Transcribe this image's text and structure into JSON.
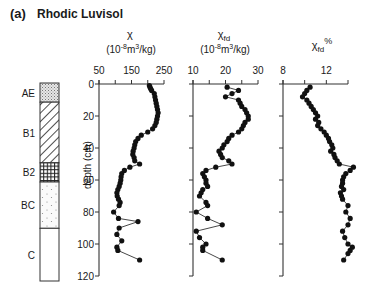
{
  "panel_label": "(a)",
  "title": "Rhodic Luvisol",
  "y_axis": {
    "label": "depth (cm)",
    "ticks": [
      0,
      20,
      40,
      60,
      80,
      100,
      120
    ],
    "range": [
      0,
      120
    ]
  },
  "horizons": [
    {
      "name": "AE",
      "top": 0,
      "bottom": 12,
      "pattern": "stipple"
    },
    {
      "name": "B1",
      "top": 12,
      "bottom": 50,
      "pattern": "diagonal-hatch"
    },
    {
      "name": "B2",
      "top": 50,
      "bottom": 62,
      "pattern": "crosshatch"
    },
    {
      "name": "BC",
      "top": 62,
      "bottom": 91,
      "pattern": "dots"
    },
    {
      "name": "C",
      "top": 91,
      "bottom": 124,
      "pattern": "blank"
    }
  ],
  "chart_data": [
    {
      "type": "line",
      "title": "χ",
      "unit": "(10-8m3/kg)",
      "xlabel": "χ (10^-8 m^3/kg)",
      "ylabel": "depth (cm)",
      "x_ticks": [
        "50",
        "150",
        "250"
      ],
      "xlim": [
        50,
        250
      ],
      "ylim": [
        0,
        120
      ],
      "depth": [
        1,
        2,
        3,
        4,
        6,
        8,
        10,
        12,
        14,
        16,
        18,
        20,
        22,
        24,
        26,
        28,
        30,
        32,
        34,
        36,
        38,
        40,
        42,
        44,
        46,
        48,
        50,
        52,
        54,
        56,
        58,
        60,
        62,
        64,
        66,
        68,
        70,
        72,
        74,
        76,
        80,
        84,
        86,
        90,
        94,
        98,
        102,
        104,
        110
      ],
      "values": [
        205,
        207,
        209,
        212,
        220,
        222,
        224,
        226,
        228,
        230,
        232,
        230,
        228,
        226,
        222,
        215,
        200,
        180,
        170,
        163,
        160,
        158,
        155,
        154,
        158,
        160,
        175,
        145,
        128,
        120,
        118,
        117,
        115,
        112,
        108,
        105,
        106,
        110,
        115,
        112,
        95,
        110,
        170,
        112,
        105,
        120,
        105,
        108,
        175
      ]
    },
    {
      "type": "line",
      "title": "χfd",
      "unit": "(10-8m3/kg)",
      "xlabel": "χfd (10^-8 m^3/kg)",
      "ylabel": "depth (cm)",
      "x_ticks": [
        "10",
        "20",
        "30"
      ],
      "xlim": [
        10,
        30
      ],
      "ylim": [
        0,
        120
      ],
      "depth": [
        2,
        4,
        6,
        8,
        10,
        12,
        14,
        16,
        18,
        20,
        22,
        24,
        26,
        28,
        30,
        32,
        34,
        36,
        38,
        40,
        42,
        44,
        46,
        48,
        50,
        52,
        54,
        56,
        58,
        60,
        62,
        64,
        66,
        68,
        70,
        74,
        76,
        80,
        84,
        88,
        92,
        96,
        100,
        102,
        104,
        110
      ],
      "values": [
        20.5,
        24,
        22,
        20,
        24,
        24.5,
        25,
        26,
        26.5,
        27,
        27,
        26,
        25.5,
        25,
        24,
        22,
        21,
        20.5,
        19.5,
        19,
        18,
        18.5,
        19,
        21,
        22,
        17,
        14,
        13,
        13.5,
        14,
        14,
        14.5,
        13,
        12.5,
        12,
        14,
        14.5,
        11,
        14.5,
        19,
        11,
        12,
        14,
        13,
        13,
        19
      ]
    },
    {
      "type": "line",
      "title": "χfd%",
      "unit": "",
      "xlabel": "χfd %",
      "ylabel": "depth (cm)",
      "x_ticks": [
        "8",
        "12"
      ],
      "xlim": [
        8,
        14
      ],
      "ylim": [
        0,
        120
      ],
      "depth": [
        2,
        4,
        6,
        8,
        10,
        12,
        14,
        16,
        18,
        20,
        22,
        24,
        26,
        28,
        30,
        32,
        34,
        36,
        38,
        40,
        42,
        44,
        46,
        48,
        50,
        52,
        54,
        56,
        58,
        60,
        62,
        64,
        66,
        68,
        70,
        72,
        76,
        80,
        84,
        88,
        92,
        96,
        100,
        102,
        104,
        106,
        110
      ],
      "values": [
        10.5,
        10.2,
        10,
        9.8,
        10.2,
        10.4,
        10.6,
        10.8,
        11,
        11.2,
        11,
        11.3,
        11.2,
        11.5,
        11.8,
        12,
        12.2,
        12.3,
        12.5,
        12.6,
        12.4,
        12.7,
        12.8,
        13,
        13.2,
        14.5,
        14.2,
        13.8,
        13.6,
        13.5,
        13.5,
        13.4,
        13.6,
        13.3,
        13.4,
        13.5,
        14,
        13.8,
        14.2,
        14,
        13.5,
        13.7,
        14,
        14.4,
        14.2,
        14,
        13.6
      ]
    }
  ]
}
